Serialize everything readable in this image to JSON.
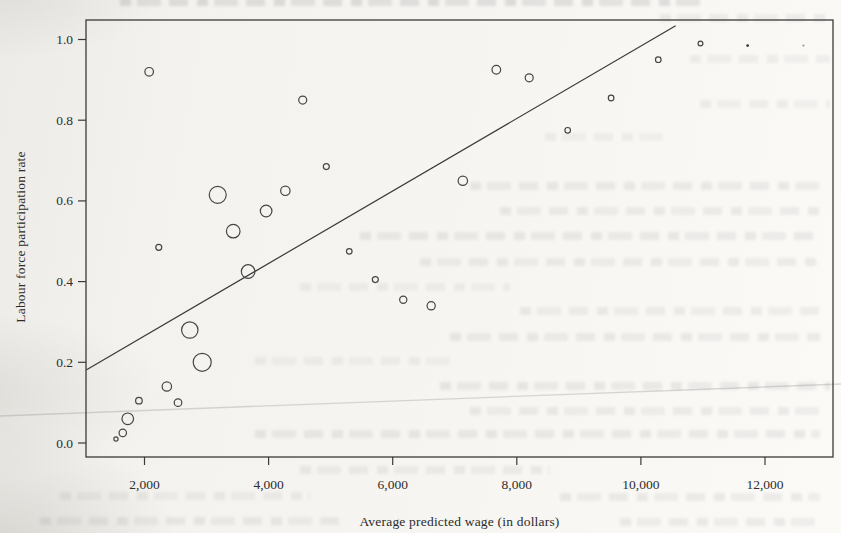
{
  "chart_data": {
    "type": "scatter",
    "subtype": "bubble-with-regression-line",
    "title": "",
    "xlabel": "Average predicted wage (in dollars)",
    "ylabel": "Labour force participation rate",
    "xlim": [
      1050,
      13100
    ],
    "ylim": [
      -0.035,
      1.047
    ],
    "grid": false,
    "legend": "none",
    "ink_color": "#3a3a3a",
    "paper_color": "#f4f3ef",
    "marker_note": "open circles of varying diameter (bubble sizes); two smallest top-right points are filled dots",
    "x_ticks": [
      {
        "label": "2,000",
        "value": 2000
      },
      {
        "label": "4,000",
        "value": 4000
      },
      {
        "label": "6,000",
        "value": 6000
      },
      {
        "label": "8,000",
        "value": 8000
      },
      {
        "label": "10,000",
        "value": 10000
      },
      {
        "label": "12,000",
        "value": 12000
      }
    ],
    "y_ticks": [
      {
        "label": "0.0",
        "value": 0.0
      },
      {
        "label": "0.2",
        "value": 0.2
      },
      {
        "label": "0.4",
        "value": 0.4
      },
      {
        "label": "0.6",
        "value": 0.6
      },
      {
        "label": "0.8",
        "value": 0.8
      },
      {
        "label": "1.0",
        "value": 1.0
      }
    ],
    "points": [
      {
        "wage": 2075,
        "rate": 0.92,
        "r": 4.3,
        "style": "open"
      },
      {
        "wage": 4550,
        "rate": 0.85,
        "r": 4.0,
        "style": "open"
      },
      {
        "wage": 7670,
        "rate": 0.925,
        "r": 4.3,
        "style": "open"
      },
      {
        "wage": 8200,
        "rate": 0.905,
        "r": 4.0,
        "style": "open"
      },
      {
        "wage": 10280,
        "rate": 0.95,
        "r": 2.8,
        "style": "open"
      },
      {
        "wage": 10960,
        "rate": 0.99,
        "r": 2.4,
        "style": "open"
      },
      {
        "wage": 11720,
        "rate": 0.985,
        "r": 1.4,
        "style": "filled"
      },
      {
        "wage": 12620,
        "rate": 0.985,
        "r": 1.1,
        "style": "filled-faint"
      },
      {
        "wage": 9520,
        "rate": 0.855,
        "r": 2.8,
        "style": "open"
      },
      {
        "wage": 8820,
        "rate": 0.775,
        "r": 2.8,
        "style": "open"
      },
      {
        "wage": 4930,
        "rate": 0.685,
        "r": 3.0,
        "style": "open"
      },
      {
        "wage": 7130,
        "rate": 0.65,
        "r": 4.7,
        "style": "open"
      },
      {
        "wage": 3180,
        "rate": 0.615,
        "r": 8.5,
        "style": "open"
      },
      {
        "wage": 4270,
        "rate": 0.625,
        "r": 4.7,
        "style": "open"
      },
      {
        "wage": 3960,
        "rate": 0.575,
        "r": 5.8,
        "style": "open"
      },
      {
        "wage": 3430,
        "rate": 0.525,
        "r": 6.8,
        "style": "open"
      },
      {
        "wage": 2230,
        "rate": 0.485,
        "r": 3.0,
        "style": "open"
      },
      {
        "wage": 3670,
        "rate": 0.425,
        "r": 6.8,
        "style": "open"
      },
      {
        "wage": 5300,
        "rate": 0.475,
        "r": 2.8,
        "style": "open"
      },
      {
        "wage": 5720,
        "rate": 0.405,
        "r": 3.0,
        "style": "open"
      },
      {
        "wage": 6170,
        "rate": 0.355,
        "r": 3.6,
        "style": "open"
      },
      {
        "wage": 6620,
        "rate": 0.34,
        "r": 4.1,
        "style": "open"
      },
      {
        "wage": 2730,
        "rate": 0.28,
        "r": 8.2,
        "style": "open"
      },
      {
        "wage": 2930,
        "rate": 0.2,
        "r": 9.0,
        "style": "open"
      },
      {
        "wage": 2360,
        "rate": 0.14,
        "r": 4.7,
        "style": "open"
      },
      {
        "wage": 1910,
        "rate": 0.105,
        "r": 3.3,
        "style": "open"
      },
      {
        "wage": 2540,
        "rate": 0.1,
        "r": 3.8,
        "style": "open"
      },
      {
        "wage": 1730,
        "rate": 0.06,
        "r": 5.8,
        "style": "open"
      },
      {
        "wage": 1650,
        "rate": 0.025,
        "r": 3.7,
        "style": "open"
      },
      {
        "wage": 1540,
        "rate": 0.01,
        "r": 2.1,
        "style": "open"
      }
    ],
    "regression_line": {
      "x1_wage": 1060,
      "y1_rate": 0.181,
      "x2_wage": 10560,
      "y2_rate": 1.034
    }
  }
}
